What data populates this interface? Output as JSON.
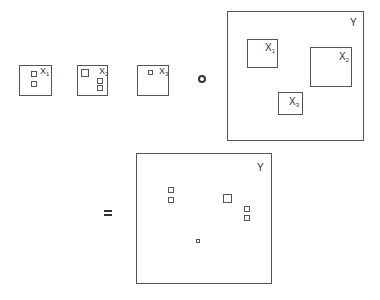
{
  "diagram": {
    "operators": {
      "compose": "composition-circle",
      "equals": "="
    },
    "inputs": [
      {
        "id": "X1",
        "base": "X",
        "sub": "1",
        "box": {
          "x": 19,
          "y": 65,
          "w": 33,
          "h": 31
        },
        "label_pos": {
          "x": 40,
          "y": 66
        },
        "squares": [
          {
            "x": 31,
            "y": 71,
            "w": 6,
            "h": 6
          },
          {
            "x": 31,
            "y": 81,
            "w": 6,
            "h": 6
          }
        ]
      },
      {
        "id": "X2",
        "base": "X",
        "sub": "2",
        "box": {
          "x": 77,
          "y": 65,
          "w": 31,
          "h": 31
        },
        "label_pos": {
          "x": 99,
          "y": 66
        },
        "squares": [
          {
            "x": 81,
            "y": 69,
            "w": 8,
            "h": 8
          },
          {
            "x": 97,
            "y": 78,
            "w": 6,
            "h": 6
          },
          {
            "x": 97,
            "y": 85,
            "w": 6,
            "h": 6
          }
        ]
      },
      {
        "id": "X3",
        "base": "X",
        "sub": "3",
        "box": {
          "x": 137,
          "y": 65,
          "w": 32,
          "h": 31
        },
        "label_pos": {
          "x": 159,
          "y": 66
        },
        "squares": [
          {
            "x": 148,
            "y": 70,
            "w": 5,
            "h": 5
          }
        ]
      }
    ],
    "target": {
      "id": "Y",
      "label": "Y",
      "box": {
        "x": 227,
        "y": 11,
        "w": 137,
        "h": 130
      },
      "label_pos": {
        "x": 350,
        "y": 18
      },
      "slots": [
        {
          "label_base": "X",
          "label_sub": "1",
          "box": {
            "x": 247,
            "y": 39,
            "w": 31,
            "h": 29
          },
          "label_pos": {
            "x": 265,
            "y": 43
          }
        },
        {
          "label_base": "X",
          "label_sub": "2",
          "box": {
            "x": 310,
            "y": 47,
            "w": 42,
            "h": 40
          },
          "label_pos": {
            "x": 339,
            "y": 52
          }
        },
        {
          "label_base": "X",
          "label_sub": "3",
          "box": {
            "x": 278,
            "y": 92,
            "w": 25,
            "h": 23
          },
          "label_pos": {
            "x": 289,
            "y": 97
          }
        }
      ]
    },
    "result": {
      "id": "Y",
      "label": "Y",
      "box": {
        "x": 136,
        "y": 153,
        "w": 136,
        "h": 131
      },
      "label_pos": {
        "x": 257,
        "y": 163
      },
      "squares": [
        {
          "x": 168,
          "y": 187,
          "w": 6,
          "h": 6
        },
        {
          "x": 168,
          "y": 197,
          "w": 6,
          "h": 6
        },
        {
          "x": 223,
          "y": 194,
          "w": 9,
          "h": 9
        },
        {
          "x": 244,
          "y": 206,
          "w": 6,
          "h": 6
        },
        {
          "x": 244,
          "y": 215,
          "w": 6,
          "h": 6
        },
        {
          "x": 196,
          "y": 239,
          "w": 4,
          "h": 4
        }
      ]
    }
  }
}
